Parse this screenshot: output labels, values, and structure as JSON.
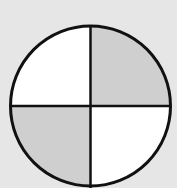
{
  "diagram": {
    "type": "fraction-circle",
    "total_parts": 4,
    "shaded_parts": 2,
    "shaded_quadrants": [
      "top-right",
      "bottom-left"
    ],
    "unshaded_quadrants": [
      "top-left",
      "bottom-right"
    ],
    "colors": {
      "background": "#e6e6e6",
      "shaded": "#cfcfcf",
      "unshaded": "#ffffff",
      "stroke": "#111111"
    }
  }
}
